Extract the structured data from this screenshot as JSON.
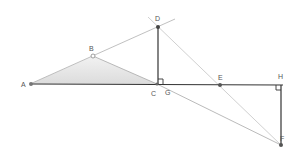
{
  "diagram": {
    "type": "geometry",
    "points": {
      "A": {
        "label": "A",
        "x": 30,
        "y": 84
      },
      "B": {
        "label": "B",
        "x": 93,
        "y": 56
      },
      "C": {
        "label": "C",
        "x": 157,
        "y": 84
      },
      "D": {
        "label": "D",
        "x": 158,
        "y": 27
      },
      "E": {
        "label": "E",
        "x": 220,
        "y": 85
      },
      "H": {
        "label": "H",
        "x": 281,
        "y": 85
      },
      "F": {
        "label": "F",
        "x": 281,
        "y": 145
      },
      "G": {
        "label": "G",
        "x": 166,
        "y": 89
      }
    },
    "labels": {
      "A": "A",
      "B": "B",
      "C": "C",
      "D": "D",
      "E": "E",
      "F": "F",
      "G": "G",
      "H": "H"
    },
    "segments": [
      "A-H (dark)",
      "D-C (dark)",
      "H-F (dark)",
      "A-D extended (light)",
      "B-C (light)",
      "D-F extended (light)",
      "C-F (light)"
    ],
    "shaded_region": "triangle ABC",
    "right_angles": [
      "C (between DC and CH)",
      "H (between AH and HF)"
    ],
    "colors": {
      "dark_line": "#333333",
      "light_line": "#aaaaaa",
      "shade": "#e6e6e6",
      "label": "#555555"
    }
  }
}
